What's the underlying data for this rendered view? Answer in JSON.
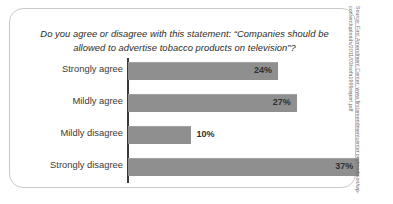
{
  "chart_data": {
    "type": "bar",
    "orientation": "horizontal",
    "title": "Do you agree or disagree with this statement: “Companies should be allowed to advertise tobacco products on television”?",
    "categories": [
      "Strongly agree",
      "Mildly agree",
      "Mildly disagree",
      "Strongly disagree"
    ],
    "values": [
      24,
      27,
      10,
      37
    ],
    "value_labels": [
      "24%",
      "27%",
      "10%",
      "37%"
    ],
    "label_placement": [
      "inside",
      "inside",
      "outside",
      "inside"
    ],
    "xlabel": "",
    "ylabel": "",
    "xlim": [
      0,
      37
    ],
    "grid": false,
    "legend": null,
    "bar_color": "#8f8f8f",
    "axis_color": "#3a3a3a",
    "text_color": "#3a3a3a"
  },
  "frame": {
    "border_color": "#c9c9c9"
  },
  "source": {
    "text": "Source: First Amendment Center: www.firstamendmentcenter.org/madison/wp-content/uploads/2011/03/sofa1999report.pdf"
  }
}
